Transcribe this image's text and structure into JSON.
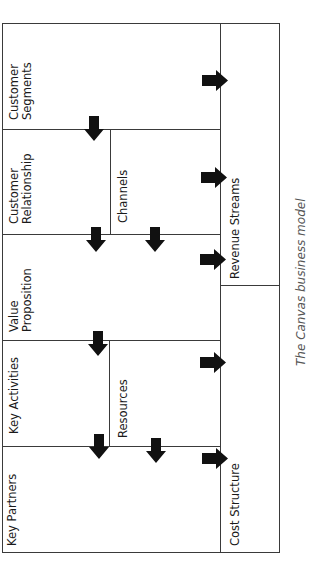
{
  "diagram": {
    "blocks": [
      {
        "id": "customer-segments",
        "label_line1": "Customer",
        "label_line2": "Segments"
      },
      {
        "id": "customer-relationship",
        "label_line1": "Customer",
        "label_line2": "Relationship"
      },
      {
        "id": "channels",
        "label_line1": "Channels",
        "label_line2": ""
      },
      {
        "id": "value-proposition",
        "label_line1": "Value",
        "label_line2": "Proposition"
      },
      {
        "id": "key-activities",
        "label_line1": "Key Activities",
        "label_line2": ""
      },
      {
        "id": "resources",
        "label_line1": "Resources",
        "label_line2": ""
      },
      {
        "id": "key-partners",
        "label_line1": "Key Partners",
        "label_line2": ""
      },
      {
        "id": "revenue-streams",
        "label_line1": "Revenue Streams",
        "label_line2": ""
      },
      {
        "id": "cost-structure",
        "label_line1": "Cost Structure",
        "label_line2": ""
      }
    ],
    "caption": "The Canvas business model",
    "line_color": "#3a3a3a",
    "arrow_color": "#111111"
  }
}
